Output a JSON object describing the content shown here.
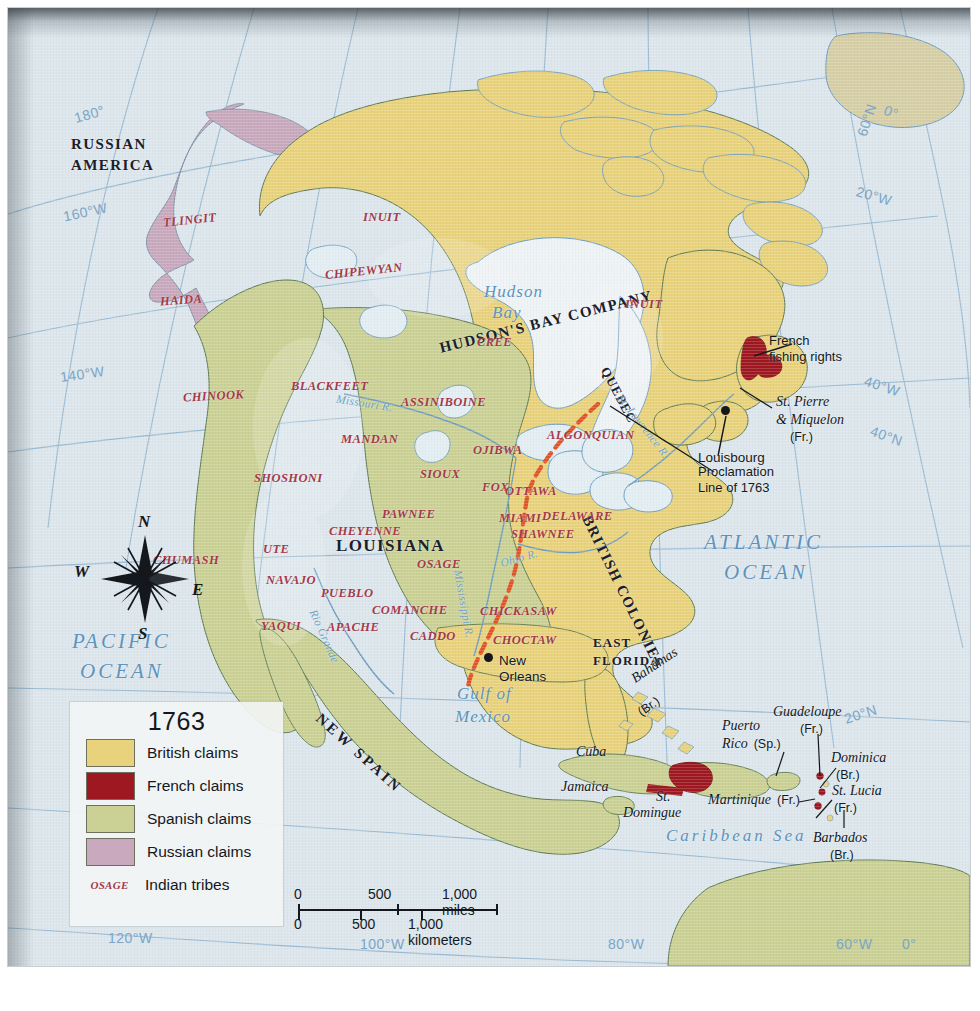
{
  "map": {
    "title_year": "1763",
    "colors": {
      "british": "#e9d27c",
      "french": "#9e1821",
      "spanish": "#cbd194",
      "russian": "#c8a9bd",
      "ocean": "#dce6ec",
      "tribe_text": "#a33a4a",
      "water_text": "#5d93bd",
      "proclamation_line": "#e0542a",
      "graticule": "#8fb4d0"
    },
    "legend": {
      "year": "1763",
      "items": [
        {
          "label": "British claims",
          "color": "#e9d27c",
          "type": "swatch"
        },
        {
          "label": "French claims",
          "color": "#9e1821",
          "type": "swatch"
        },
        {
          "label": "Spanish claims",
          "color": "#cbd194",
          "type": "swatch"
        },
        {
          "label": "Russian claims",
          "color": "#c8a9bd",
          "type": "swatch"
        },
        {
          "label": "Indian tribes",
          "sample": "OSAGE",
          "type": "tribe"
        }
      ]
    },
    "scale": {
      "miles": {
        "ticks": [
          "0",
          "500",
          "1,000"
        ],
        "unit_label": "1,000 miles"
      },
      "kilometers": {
        "ticks": [
          "0",
          "500",
          "1,000"
        ],
        "unit_label": "1,000 kilometers"
      }
    },
    "compass": {
      "n": "N",
      "s": "S",
      "e": "E",
      "w": "W"
    },
    "regions": [
      {
        "name": "RUSSIAN AMERICA",
        "line1": "RUSSIAN",
        "line2": "AMERICA"
      },
      {
        "name": "HUDSON'S BAY COMPANY"
      },
      {
        "name": "QUEBEC"
      },
      {
        "name": "LOUISIANA"
      },
      {
        "name": "BRITISH COLONIES"
      },
      {
        "name": "NEW SPAIN"
      },
      {
        "name": "EAST FLORIDA",
        "line1": "EAST",
        "line2": "FLORIDA"
      }
    ],
    "tribes": [
      "TLINGIT",
      "HAIDA",
      "INUIT",
      "CHIPEWYAN",
      "CHINOOK",
      "BLACKFEET",
      "ASSINIBOINE",
      "CREE",
      "INUIT",
      "MANDAN",
      "OJIBWA",
      "ALGONQUIAN",
      "SHOSHONI",
      "SIOUX",
      "FOX",
      "OTTAWA",
      "PAWNEE",
      "MIAMI",
      "DELAWARE",
      "CHEYENNE",
      "SHAWNEE",
      "UTE",
      "CHUMASH",
      "OSAGE",
      "NAVAJO",
      "PUEBLO",
      "COMANCHE",
      "CHICKASAW",
      "YAQUI",
      "APACHE",
      "CADDO",
      "CHOCTAW"
    ],
    "water_labels": [
      "Hudson Bay",
      "ATLANTIC OCEAN",
      "PACIFIC OCEAN",
      "Gulf of Mexico",
      "Caribbean Sea"
    ],
    "rivers": [
      "Missouri R.",
      "St. Lawrence R.",
      "Mississippi R.",
      "Ohio R.",
      "Rio Grande"
    ],
    "places": [
      "Louisbourg",
      "New Orleans"
    ],
    "annotations": [
      {
        "text_line1": "French",
        "text_line2": "fishing rights"
      },
      {
        "text_line1": "Proclamation",
        "text_line2": "Line of 1763"
      }
    ],
    "islands": [
      {
        "name": "St. Pierre & Miquelon",
        "line1": "St. Pierre",
        "line2": "& Miquelon",
        "owner": "(Fr.)"
      },
      {
        "name": "Bahamas",
        "owner": "(Br.)"
      },
      {
        "name": "Cuba",
        "owner": ""
      },
      {
        "name": "Jamaica",
        "owner": ""
      },
      {
        "name": "St. Domingue",
        "line1": "St.",
        "line2": "Domingue",
        "owner": ""
      },
      {
        "name": "Puerto Rico",
        "line1": "Puerto",
        "line2": "Rico",
        "owner": "(Sp.)"
      },
      {
        "name": "Guadeloupe",
        "owner": "(Fr.)"
      },
      {
        "name": "Dominica",
        "owner": "(Br.)"
      },
      {
        "name": "Martinique",
        "owner": "(Fr.)"
      },
      {
        "name": "St. Lucia",
        "owner": "(Fr.)"
      },
      {
        "name": "Barbados",
        "owner": "(Br.)"
      }
    ],
    "graticule": [
      "180°",
      "160°W",
      "140°W",
      "120°W",
      "100°W",
      "80°W",
      "60°W",
      "40°W",
      "20°W",
      "0°",
      "60°N",
      "40°N",
      "20°N"
    ],
    "graticule_labels": {
      "l180": "180°",
      "l160w": "160°W",
      "l140w": "140°W",
      "l120w": "120°W",
      "l100w": "100°W",
      "l80w": "80°W",
      "l60w": "60°W",
      "l40w": "40°W",
      "l20w": "20°W",
      "l0a": "0°",
      "l0b": "0°",
      "l60n_top": "60°N",
      "l60n_right": "60°N",
      "l40n": "40°N",
      "l20n": "20°N"
    },
    "label_text": {
      "russian_america_1": "RUSSIAN",
      "russian_america_2": "AMERICA",
      "tlingit": "TLINGIT",
      "haida": "HAIDA",
      "inuit_nw": "INUIT",
      "inuit_ne": "INUIT",
      "chipewyan": "CHIPEWYAN",
      "chinook": "CHINOOK",
      "blackfeet": "BLACKFEET",
      "assiniboine": "ASSINIBOINE",
      "cree": "CREE",
      "mandan": "MANDAN",
      "ojibwa": "OJIBWA",
      "algonquian": "ALGONQUIAN",
      "shoshoni": "SHOSHONI",
      "sioux": "SIOUX",
      "fox": "FOX",
      "ottawa": "OTTAWA",
      "pawnee": "PAWNEE",
      "miami": "MIAMI",
      "delaware": "DELAWARE",
      "cheyenne": "CHEYENNE",
      "shawnee": "SHAWNEE",
      "ute": "UTE",
      "chumash": "CHUMASH",
      "osage": "OSAGE",
      "navajo": "NAVAJO",
      "pueblo": "PUEBLO",
      "comanche": "COMANCHE",
      "chickasaw": "CHICKASAW",
      "yaqui": "YAQUI",
      "apache": "APACHE",
      "caddo": "CADDO",
      "choctaw": "CHOCTAW",
      "hudsons_bay_company": "HUDSON'S BAY COMPANY",
      "quebec": "QUEBEC",
      "louisiana": "LOUISIANA",
      "british_colonies": "BRITISH COLONIES",
      "new_spain": "NEW SPAIN",
      "east_florida_1": "EAST",
      "east_florida_2": "FLORIDA",
      "hudson_bay_1": "Hudson",
      "hudson_bay_2": "Bay",
      "atlantic_1": "ATLANTIC",
      "atlantic_2": "OCEAN",
      "pacific_1": "PACIFIC",
      "pacific_2": "OCEAN",
      "gulf_1": "Gulf of",
      "gulf_2": "Mexico",
      "caribbean": "Caribbean Sea",
      "missouri_r": "Missouri R.",
      "st_lawrence_r": "St. Lawrence R.",
      "mississippi_r": "Mississippi R.",
      "ohio_r": "Ohio R.",
      "rio_grande": "Rio Grande",
      "louisbourg": "Louisbourg",
      "new_orleans_1": "New",
      "new_orleans_2": "Orleans",
      "french_fishing_1": "French",
      "french_fishing_2": "fishing rights",
      "proclamation_1": "Proclamation",
      "proclamation_2": "Line of 1763",
      "st_pierre_1": "St. Pierre",
      "st_pierre_2": "& Miquelon",
      "st_pierre_3": "(Fr.)",
      "bahamas": "Bahamas",
      "bahamas_owner": "(Br.)",
      "cuba": "Cuba",
      "jamaica": "Jamaica",
      "st_domingue_1": "St.",
      "st_domingue_2": "Domingue",
      "puerto_rico_1": "Puerto",
      "puerto_rico_2": "Rico",
      "puerto_rico_owner": "(Sp.)",
      "guadeloupe": "Guadeloupe",
      "guadeloupe_owner": "(Fr.)",
      "dominica": "Dominica",
      "dominica_owner": "(Br.)",
      "martinique": "Martinique",
      "martinique_owner": "(Fr.)",
      "st_lucia": "St. Lucia",
      "st_lucia_owner": "(Fr.)",
      "barbados": "Barbados",
      "barbados_owner": "(Br.)"
    }
  }
}
